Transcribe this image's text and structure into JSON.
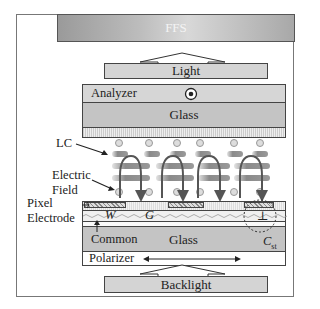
{
  "banner": {
    "label": "FFS"
  },
  "top_light": {
    "label": "Light"
  },
  "analyzer": {
    "label": "Analyzer",
    "polarization_symbol": "out-of-plane (dot)"
  },
  "top_glass": {
    "label": "Glass"
  },
  "annotations": {
    "lc": "LC",
    "electric_field_line1": "Electric",
    "electric_field_line2": "Field",
    "pixel_electrode_line1": "Pixel",
    "pixel_electrode_line2": "Electrode",
    "common": "Common",
    "w": "W",
    "g": "G",
    "cst_main": "C",
    "cst_sub": "st",
    "cap_symbol": "⊥"
  },
  "bottom_glass": {
    "label": "Glass"
  },
  "polarizer": {
    "label": "Polarizer",
    "direction": "horizontal (double arrow)"
  },
  "backlight": {
    "label": "Backlight"
  },
  "colors": {
    "banner_gray": "#b0b0b0",
    "glass_gray": "#c4c4c4",
    "box_gray": "#d4d4d4",
    "lc_gray": "#8a8a8a",
    "field_arrow": "#555555"
  }
}
